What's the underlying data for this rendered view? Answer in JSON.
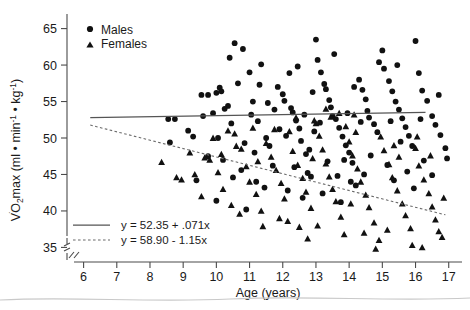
{
  "chart_data": {
    "type": "scatter",
    "title": "",
    "xlabel": "Age (years)",
    "ylabel_parts": {
      "prefix": "V",
      "dot": "̇",
      "o": "O",
      "sub2": "2",
      "max": "max",
      "units_open": " (ml • min",
      "exp1": "-1",
      "units_mid": " • kg",
      "exp2": "-1",
      "units_close": ")"
    },
    "ylabel_plain": "VO2max (ml • min-1 • kg-1)",
    "xlim": [
      5.5,
      17.4
    ],
    "ylim": [
      33.0,
      67.0
    ],
    "xticks": [
      6,
      7,
      8,
      9,
      10,
      11,
      12,
      13,
      14,
      15,
      16,
      17
    ],
    "yticks": [
      35,
      40,
      45,
      50,
      55,
      60,
      65
    ],
    "grid": false,
    "axis_break": true,
    "legend_position": "top-left",
    "series": [
      {
        "name": "Males",
        "marker": "circle",
        "color": "#111111",
        "points": [
          [
            8.55,
            52.6
          ],
          [
            8.75,
            52.6
          ],
          [
            8.6,
            49.4
          ],
          [
            9.15,
            51.0
          ],
          [
            9.3,
            50.2
          ],
          [
            9.55,
            55.9
          ],
          [
            9.75,
            55.9
          ],
          [
            10.0,
            56.2
          ],
          [
            10.1,
            56.9
          ],
          [
            10.15,
            56.4
          ],
          [
            10.35,
            54.4
          ],
          [
            10.4,
            61.0
          ],
          [
            10.55,
            63.0
          ],
          [
            10.8,
            62.2
          ],
          [
            10.25,
            54.0
          ],
          [
            9.9,
            53.4
          ],
          [
            9.75,
            47.5
          ],
          [
            10.2,
            47.0
          ],
          [
            10.5,
            44.6
          ],
          [
            10.75,
            45.6
          ],
          [
            11.0,
            59.0
          ],
          [
            11.1,
            55.0
          ],
          [
            11.25,
            52.3
          ],
          [
            11.3,
            57.3
          ],
          [
            11.5,
            50.0
          ],
          [
            11.6,
            48.9
          ],
          [
            11.75,
            53.9
          ],
          [
            11.9,
            51.2
          ],
          [
            12.0,
            56.0
          ],
          [
            12.05,
            55.1
          ],
          [
            12.2,
            58.9
          ],
          [
            12.3,
            53.5
          ],
          [
            12.4,
            52.4
          ],
          [
            12.5,
            51.3
          ],
          [
            12.55,
            49.6
          ],
          [
            12.7,
            47.8
          ],
          [
            12.85,
            44.7
          ],
          [
            12.9,
            56.3
          ],
          [
            13.0,
            63.5
          ],
          [
            13.05,
            60.7
          ],
          [
            13.15,
            59.0
          ],
          [
            13.25,
            57.4
          ],
          [
            13.3,
            56.7
          ],
          [
            13.4,
            55.2
          ],
          [
            13.45,
            54.2
          ],
          [
            13.5,
            53.0
          ],
          [
            13.6,
            52.6
          ],
          [
            13.7,
            51.4
          ],
          [
            13.8,
            50.2
          ],
          [
            13.9,
            49.0
          ],
          [
            14.0,
            48.0
          ],
          [
            14.1,
            46.6
          ],
          [
            14.15,
            57.0
          ],
          [
            14.3,
            58.0
          ],
          [
            14.4,
            56.6
          ],
          [
            14.5,
            55.3
          ],
          [
            14.55,
            53.7
          ],
          [
            14.6,
            52.8
          ],
          [
            14.75,
            51.9
          ],
          [
            14.85,
            50.8
          ],
          [
            15.0,
            62.0
          ],
          [
            15.05,
            59.5
          ],
          [
            15.2,
            57.8
          ],
          [
            15.3,
            56.4
          ],
          [
            15.4,
            55.0
          ],
          [
            15.5,
            53.9
          ],
          [
            15.6,
            52.7
          ],
          [
            15.7,
            51.5
          ],
          [
            15.8,
            50.3
          ],
          [
            15.9,
            48.9
          ],
          [
            16.0,
            63.3
          ],
          [
            16.1,
            58.9
          ],
          [
            16.2,
            56.5
          ],
          [
            16.35,
            55.1
          ],
          [
            16.5,
            53.0
          ],
          [
            16.6,
            51.8
          ],
          [
            16.75,
            50.4
          ],
          [
            16.9,
            48.6
          ],
          [
            16.95,
            47.2
          ],
          [
            16.5,
            44.9
          ],
          [
            11.2,
            44.0
          ],
          [
            11.45,
            43.2
          ],
          [
            12.15,
            42.8
          ],
          [
            12.6,
            41.8
          ],
          [
            13.2,
            42.4
          ],
          [
            13.75,
            41.2
          ],
          [
            14.2,
            43.5
          ],
          [
            9.4,
            44.2
          ],
          [
            10.0,
            41.4
          ],
          [
            10.9,
            40.2
          ],
          [
            11.7,
            46.2
          ],
          [
            12.35,
            46.0
          ],
          [
            12.75,
            45.2
          ],
          [
            13.35,
            46.8
          ],
          [
            14.45,
            45.0
          ],
          [
            15.15,
            46.3
          ],
          [
            15.75,
            45.4
          ],
          [
            16.25,
            46.9
          ],
          [
            12.45,
            59.8
          ],
          [
            11.85,
            57.0
          ],
          [
            10.65,
            57.5
          ],
          [
            13.55,
            61.5
          ],
          [
            14.9,
            60.4
          ],
          [
            15.45,
            60.0
          ],
          [
            11.35,
            60.1
          ],
          [
            12.1,
            50.3
          ],
          [
            12.95,
            50.9
          ],
          [
            13.85,
            47.0
          ],
          [
            14.65,
            47.6
          ],
          [
            15.55,
            49.5
          ],
          [
            9.6,
            53.0
          ],
          [
            10.45,
            52.0
          ],
          [
            11.05,
            53.2
          ],
          [
            11.55,
            54.8
          ],
          [
            12.25,
            54.1
          ],
          [
            12.65,
            53.2
          ],
          [
            13.12,
            52.1
          ],
          [
            13.95,
            53.4
          ],
          [
            14.35,
            52.2
          ],
          [
            15.25,
            52.3
          ],
          [
            16.15,
            52.6
          ],
          [
            16.7,
            55.9
          ],
          [
            10.05,
            50.0
          ],
          [
            10.85,
            49.3
          ],
          [
            11.15,
            48.0
          ],
          [
            12.8,
            48.4
          ],
          [
            13.65,
            44.8
          ],
          [
            14.05,
            44.0
          ],
          [
            15.35,
            44.2
          ],
          [
            15.95,
            43.1
          ]
        ]
      },
      {
        "name": "Females",
        "marker": "triangle",
        "color": "#111111",
        "points": [
          [
            8.35,
            46.7
          ],
          [
            8.8,
            44.6
          ],
          [
            8.95,
            44.3
          ],
          [
            9.55,
            42.0
          ],
          [
            9.65,
            47.3
          ],
          [
            9.8,
            47.0
          ],
          [
            10.05,
            45.3
          ],
          [
            10.2,
            43.0
          ],
          [
            10.45,
            40.8
          ],
          [
            10.6,
            48.9
          ],
          [
            10.75,
            48.5
          ],
          [
            10.9,
            46.1
          ],
          [
            11.0,
            44.0
          ],
          [
            11.2,
            42.3
          ],
          [
            11.35,
            40.0
          ],
          [
            11.5,
            49.3
          ],
          [
            11.65,
            47.4
          ],
          [
            11.8,
            45.6
          ],
          [
            11.95,
            43.8
          ],
          [
            12.05,
            41.7
          ],
          [
            12.2,
            50.9
          ],
          [
            12.3,
            48.2
          ],
          [
            12.45,
            46.3
          ],
          [
            12.6,
            44.5
          ],
          [
            12.7,
            42.6
          ],
          [
            12.85,
            40.4
          ],
          [
            13.0,
            52.0
          ],
          [
            13.1,
            50.3
          ],
          [
            13.2,
            48.4
          ],
          [
            13.3,
            46.5
          ],
          [
            13.4,
            44.7
          ],
          [
            13.5,
            43.0
          ],
          [
            13.6,
            41.3
          ],
          [
            13.75,
            39.2
          ],
          [
            13.9,
            51.6
          ],
          [
            14.0,
            49.5
          ],
          [
            14.1,
            47.6
          ],
          [
            14.25,
            45.8
          ],
          [
            14.35,
            44.0
          ],
          [
            14.5,
            42.2
          ],
          [
            14.6,
            40.5
          ],
          [
            14.75,
            38.4
          ],
          [
            14.8,
            34.8
          ],
          [
            14.95,
            50.2
          ],
          [
            15.05,
            48.3
          ],
          [
            15.2,
            46.4
          ],
          [
            15.3,
            44.6
          ],
          [
            15.45,
            42.8
          ],
          [
            15.6,
            41.0
          ],
          [
            15.7,
            39.4
          ],
          [
            15.85,
            37.6
          ],
          [
            16.0,
            48.6
          ],
          [
            16.1,
            46.2
          ],
          [
            16.25,
            44.3
          ],
          [
            16.4,
            42.4
          ],
          [
            16.5,
            40.6
          ],
          [
            16.6,
            38.8
          ],
          [
            16.7,
            37.2
          ],
          [
            16.8,
            36.4
          ],
          [
            16.85,
            41.8
          ],
          [
            10.35,
            51.0
          ],
          [
            10.55,
            50.6
          ],
          [
            11.1,
            51.4
          ],
          [
            11.75,
            51.2
          ],
          [
            12.4,
            52.8
          ],
          [
            12.95,
            52.4
          ],
          [
            13.45,
            52.9
          ],
          [
            14.15,
            53.2
          ],
          [
            9.2,
            48.0
          ],
          [
            9.35,
            45.0
          ],
          [
            12.5,
            37.8
          ],
          [
            13.05,
            38.0
          ],
          [
            12.15,
            38.6
          ],
          [
            11.4,
            37.9
          ],
          [
            14.9,
            36.0
          ],
          [
            15.9,
            35.3
          ],
          [
            16.2,
            35.0
          ],
          [
            10.7,
            39.6
          ],
          [
            11.9,
            39.0
          ],
          [
            13.85,
            36.8
          ],
          [
            12.75,
            36.2
          ],
          [
            14.45,
            37.0
          ],
          [
            15.15,
            37.4
          ],
          [
            9.9,
            50.0
          ],
          [
            13.3,
            54.0
          ],
          [
            13.7,
            53.4
          ],
          [
            14.2,
            50.8
          ],
          [
            15.35,
            49.0
          ],
          [
            16.05,
            50.2
          ],
          [
            11.25,
            46.8
          ],
          [
            12.9,
            47.2
          ],
          [
            14.05,
            41.0
          ],
          [
            10.15,
            47.8
          ],
          [
            15.5,
            47.4
          ],
          [
            16.45,
            47.6
          ]
        ]
      }
    ],
    "fits": [
      {
        "name": "males-fit",
        "style": "solid",
        "equation": "y = 52.35 + .071x",
        "intercept": 52.35,
        "slope": 0.071,
        "xrange": [
          6.2,
          16.3
        ]
      },
      {
        "name": "females-fit",
        "style": "dashed",
        "equation": "y = 58.90 - 1.15x",
        "intercept": 58.9,
        "slope": -1.15,
        "xrange": [
          6.2,
          16.9
        ]
      }
    ],
    "legend_entries": [
      {
        "label": "Males",
        "marker": "circle"
      },
      {
        "label": "Females",
        "marker": "triangle"
      }
    ]
  }
}
